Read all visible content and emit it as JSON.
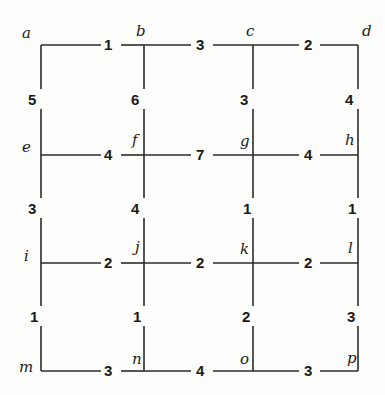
{
  "figure": {
    "width": 385,
    "height": 395,
    "background_color": "#fdfdfc",
    "line_color": "#2b2b2b",
    "text_color": "#1a1a1a"
  },
  "graph_data": {
    "type": "graph",
    "layout": "grid",
    "rows": 4,
    "cols": 4,
    "node_labels": [
      [
        "a",
        "b",
        "c",
        "d"
      ],
      [
        "e",
        "f",
        "g",
        "h"
      ],
      [
        "i",
        "j",
        "k",
        "l"
      ],
      [
        "m",
        "n",
        "o",
        "p"
      ]
    ],
    "horizontal_edges": [
      {
        "from": "a",
        "to": "b",
        "weight": "1",
        "row": 0
      },
      {
        "from": "b",
        "to": "c",
        "weight": "3",
        "row": 0
      },
      {
        "from": "c",
        "to": "d",
        "weight": "2",
        "row": 0
      },
      {
        "from": "e",
        "to": "f",
        "weight": "4",
        "row": 1
      },
      {
        "from": "f",
        "to": "g",
        "weight": "7",
        "row": 1
      },
      {
        "from": "g",
        "to": "h",
        "weight": "4",
        "row": 1
      },
      {
        "from": "i",
        "to": "j",
        "weight": "2",
        "row": 2
      },
      {
        "from": "j",
        "to": "k",
        "weight": "2",
        "row": 2
      },
      {
        "from": "k",
        "to": "l",
        "weight": "2",
        "row": 2
      },
      {
        "from": "m",
        "to": "n",
        "weight": "3",
        "row": 3
      },
      {
        "from": "n",
        "to": "o",
        "weight": "4",
        "row": 3
      },
      {
        "from": "o",
        "to": "p",
        "weight": "3",
        "row": 3
      }
    ],
    "vertical_edges": [
      {
        "from": "a",
        "to": "e",
        "weight": "5",
        "col": 0
      },
      {
        "from": "b",
        "to": "f",
        "weight": "6",
        "col": 1
      },
      {
        "from": "c",
        "to": "g",
        "weight": "3",
        "col": 2
      },
      {
        "from": "d",
        "to": "h",
        "weight": "4",
        "col": 3
      },
      {
        "from": "e",
        "to": "i",
        "weight": "3",
        "col": 0
      },
      {
        "from": "f",
        "to": "j",
        "weight": "4",
        "col": 1
      },
      {
        "from": "g",
        "to": "k",
        "weight": "1",
        "col": 2
      },
      {
        "from": "h",
        "to": "l",
        "weight": "1",
        "col": 3
      },
      {
        "from": "i",
        "to": "m",
        "weight": "1",
        "col": 0
      },
      {
        "from": "j",
        "to": "n",
        "weight": "1",
        "col": 1
      },
      {
        "from": "k",
        "to": "o",
        "weight": "2",
        "col": 2
      },
      {
        "from": "l",
        "to": "p",
        "weight": "3",
        "col": 3
      }
    ]
  },
  "nodes": {
    "a": "a",
    "b": "b",
    "c": "c",
    "d": "d",
    "e": "e",
    "f": "f",
    "g": "g",
    "h": "h",
    "i": "i",
    "j": "j",
    "k": "k",
    "l": "l",
    "m": "m",
    "n": "n",
    "o": "o",
    "p": "p"
  },
  "weights": {
    "h_r0_c0": "1",
    "h_r0_c1": "3",
    "h_r0_c2": "2",
    "h_r1_c0": "4",
    "h_r1_c1": "7",
    "h_r1_c2": "4",
    "h_r2_c0": "2",
    "h_r2_c1": "2",
    "h_r2_c2": "2",
    "h_r3_c0": "3",
    "h_r3_c1": "4",
    "h_r3_c2": "3",
    "v_c0_r0": "5",
    "v_c1_r0": "6",
    "v_c2_r0": "3",
    "v_c3_r0": "4",
    "v_c0_r1": "3",
    "v_c1_r1": "4",
    "v_c2_r1": "1",
    "v_c3_r1": "1",
    "v_c0_r2": "1",
    "v_c1_r2": "1",
    "v_c2_r2": "2",
    "v_c3_r2": "3"
  }
}
